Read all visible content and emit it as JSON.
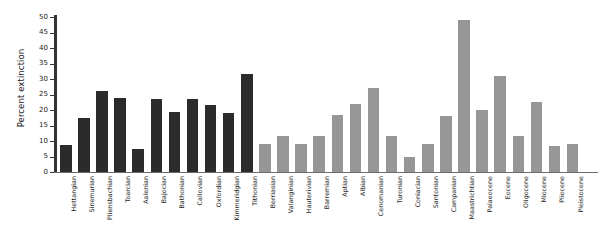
{
  "chart_data": {
    "type": "bar",
    "title": "",
    "xlabel": "",
    "ylabel": "Percent extinction",
    "ylim": [
      0,
      50
    ],
    "ytick_labels": [
      "0",
      "5",
      "10",
      "15",
      "20",
      "25",
      "30",
      "35",
      "40",
      "45",
      "50"
    ],
    "ytick_values": [
      0,
      5,
      10,
      15,
      20,
      25,
      30,
      35,
      40,
      45,
      50
    ],
    "grid": false,
    "legend": "none",
    "colors": {
      "series_dark": "#2b2b2b",
      "series_light": "#969696",
      "axis": "#333333",
      "background": "#ffffff",
      "text": "#1a1a1a"
    },
    "categories": [
      "Hettangian",
      "Sinemurian",
      "Pliensbachian",
      "Toarcian",
      "Aalenian",
      "Bajocian",
      "Bathonian",
      "Callovian",
      "Oxfordian",
      "Kimmeridgian",
      "Tithonian",
      "Berriasian",
      "Valanginian",
      "Hauterivian",
      "Barremian",
      "Aptian",
      "Albian",
      "Cenomanian",
      "Turonian",
      "Coniacian",
      "Santonian",
      "Campanian",
      "Maastrichtian",
      "Palaeocene",
      "Eocene",
      "Oligocene",
      "Miocene",
      "Pliocene",
      "Pleistocene"
    ],
    "values": [
      8.6,
      17.5,
      26.0,
      24.0,
      7.5,
      23.5,
      19.5,
      23.5,
      21.5,
      19.0,
      31.5,
      9.0,
      11.5,
      9.0,
      11.5,
      18.5,
      22.0,
      27.0,
      11.5,
      5.0,
      9.0,
      18.0,
      49.0,
      20.0,
      31.0,
      11.5,
      22.5,
      8.5,
      9.0
    ],
    "group": [
      "dark",
      "dark",
      "dark",
      "dark",
      "dark",
      "dark",
      "dark",
      "dark",
      "dark",
      "dark",
      "dark",
      "light",
      "light",
      "light",
      "light",
      "light",
      "light",
      "light",
      "light",
      "light",
      "light",
      "light",
      "light",
      "light",
      "light",
      "light",
      "light",
      "light",
      "light"
    ]
  }
}
